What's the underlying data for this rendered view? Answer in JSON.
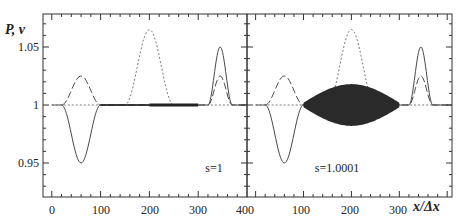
{
  "chart_data": [
    {
      "type": "line",
      "panel": "left",
      "annotation": "s=1",
      "ylabel": "P, v",
      "xlabel": "",
      "xlim": [
        -18,
        400
      ],
      "ylim": [
        0.915,
        1.08
      ],
      "x_ticks": [
        0,
        100,
        200,
        300,
        400
      ],
      "y_ticks": [
        0.95,
        1,
        1.05
      ],
      "series": [
        {
          "name": "solid (v)",
          "style": "solid",
          "points": [
            [
              0,
              1
            ],
            [
              20,
              1
            ],
            [
              60,
              0.95
            ],
            [
              100,
              1
            ],
            [
              200,
              1
            ],
            [
              300,
              1
            ],
            [
              320,
              1
            ],
            [
              345,
              1.05
            ],
            [
              370,
              1
            ],
            [
              400,
              1
            ]
          ],
          "note": "small noise band between 200 and 300"
        },
        {
          "name": "long-dash (P)",
          "style": "long-dash",
          "points": [
            [
              20,
              1
            ],
            [
              60,
              1.025
            ],
            [
              100,
              1
            ],
            [
              300,
              1
            ],
            [
              320,
              1
            ],
            [
              345,
              1.025
            ],
            [
              370,
              1
            ],
            [
              400,
              1
            ]
          ]
        },
        {
          "name": "dotted (initial)",
          "style": "dotted",
          "points": [
            [
              0,
              1
            ],
            [
              150,
              1
            ],
            [
              200,
              1.065
            ],
            [
              250,
              1
            ],
            [
              400,
              1
            ]
          ]
        }
      ]
    },
    {
      "type": "line",
      "panel": "right",
      "annotation": "s=1.0001",
      "ylabel": "",
      "xlabel": "x/Δx",
      "xlim": [
        -18,
        410
      ],
      "ylim": [
        0.915,
        1.08
      ],
      "x_ticks": [
        100,
        200,
        300
      ],
      "series": [
        {
          "name": "solid (v)",
          "style": "solid-noisy",
          "points": [
            [
              0,
              1
            ],
            [
              20,
              1
            ],
            [
              60,
              0.95
            ],
            [
              100,
              1
            ],
            [
              300,
              1
            ],
            [
              320,
              1
            ],
            [
              345,
              1.05
            ],
            [
              370,
              1
            ],
            [
              410,
              1
            ]
          ],
          "note": "large oscillation band between 100 and 300, amplitude ~±0.015 peaking near 200"
        },
        {
          "name": "long-dash (P)",
          "style": "long-dash",
          "points": [
            [
              20,
              1
            ],
            [
              60,
              1.025
            ],
            [
              100,
              1
            ],
            [
              300,
              1
            ],
            [
              320,
              1
            ],
            [
              345,
              1.025
            ],
            [
              370,
              1
            ],
            [
              410,
              1
            ]
          ]
        },
        {
          "name": "dotted (initial)",
          "style": "dotted",
          "points": [
            [
              0,
              1
            ],
            [
              150,
              1
            ],
            [
              200,
              1.065
            ],
            [
              250,
              1
            ],
            [
              410,
              1
            ]
          ]
        }
      ]
    }
  ],
  "labels": {
    "ylabel": "P, v",
    "xlabel": "x/Δx",
    "left_annotation": "s=1",
    "right_annotation": "s=1.0001",
    "y_tick_labels": [
      "1.05",
      "1",
      "0.95"
    ],
    "left_x_tick_labels": [
      "0",
      "100",
      "200",
      "300",
      "400"
    ],
    "right_x_tick_labels": [
      "100",
      "200",
      "300"
    ]
  }
}
